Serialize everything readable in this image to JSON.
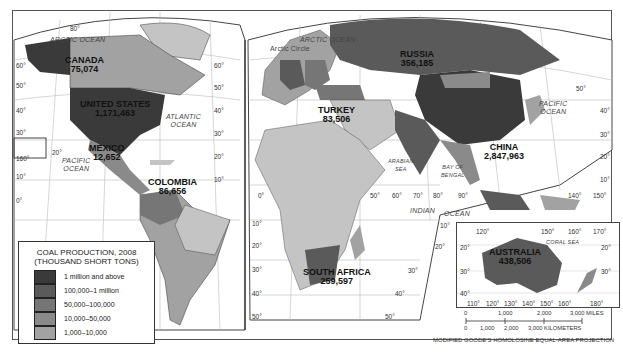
{
  "map": {
    "title": "Coal Production, 2008",
    "projection": "MODIFIED GOODE'S HOMOLOSINE EQUAL-AREA PROJECTION"
  },
  "legend": {
    "title_line1": "COAL PRODUCTION, 2008",
    "title_line2": "(THOUSAND SHORT TONS)",
    "items": [
      {
        "label": "1 million and above",
        "color": "#3a3a3a"
      },
      {
        "label": "100,000–1 million",
        "color": "#5a5a5a"
      },
      {
        "label": "50,000–100,000",
        "color": "#767676"
      },
      {
        "label": "10,000–50,000",
        "color": "#8a8a8a"
      },
      {
        "label": "1,000–10,000",
        "color": "#a2a2a2"
      },
      {
        "label": "Below 1,000",
        "color": "#c4c4c4"
      }
    ]
  },
  "countries": [
    {
      "name": "CANADA",
      "value": "75,074"
    },
    {
      "name": "UNITED STATES",
      "value": "1,171,463"
    },
    {
      "name": "MEXICO",
      "value": "12,652"
    },
    {
      "name": "COLOMBIA",
      "value": "86,656"
    },
    {
      "name": "RUSSIA",
      "value": "356,185"
    },
    {
      "name": "TURKEY",
      "value": "83,506"
    },
    {
      "name": "CHINA",
      "value": "2,847,963"
    },
    {
      "name": "SOUTH AFRICA",
      "value": "259,597"
    },
    {
      "name": "AUSTRALIA",
      "value": "438,506"
    }
  ],
  "water_labels": {
    "arctic_ocean_1": "ARCTIC OCEAN",
    "arctic_ocean_2": "ARCTIC OCEAN",
    "arctic_circle": "Arctic Circle",
    "atlantic_1": "ATLANTIC",
    "atlantic_2": "OCEAN",
    "pacific_w_1": "PACIFIC",
    "pacific_w_2": "OCEAN",
    "pacific_e_1": "PACIFIC",
    "pacific_e_2": "OCEAN",
    "arabian_1": "ARABIAN",
    "arabian_2": "SEA",
    "bengal_1": "BAY OF",
    "bengal_2": "BENGAL",
    "indian": "INDIAN",
    "indian_ocean": "OCEAN",
    "coral_sea": "CORAL  SEA"
  },
  "graticule": {
    "lat_left": [
      "80°",
      "70°",
      "60°",
      "50°",
      "40°",
      "30°",
      "20°",
      "10°",
      "0°",
      "160°"
    ],
    "mid": [
      "60°",
      "50°",
      "40°",
      "30°",
      "20°",
      "10°",
      "10°",
      "20°",
      "30°",
      "40°",
      "50°"
    ],
    "lon_equator": [
      "0°",
      "50°",
      "60°",
      "70°",
      "80°",
      "90°",
      "140°",
      "150°"
    ],
    "lat_right": [
      "50°",
      "40°",
      "30°",
      "20°",
      "10°"
    ],
    "south_right": [
      "10°",
      "20°",
      "30°",
      "40°",
      "50°"
    ],
    "inset_top": [
      "120°",
      "150°",
      "160°",
      "170°"
    ],
    "inset_lat": [
      "20°",
      "30°",
      "40°",
      "20°",
      "30°"
    ],
    "inset_bottom": [
      "110°",
      "120°",
      "130°",
      "140°",
      "150°",
      "160°",
      "180°"
    ]
  },
  "scale": {
    "miles": [
      "0",
      "1,000",
      "2,000",
      "3,000 MILES"
    ],
    "km": [
      "0",
      "1,000",
      "2,000",
      "3,000 KILOMETERS"
    ]
  }
}
